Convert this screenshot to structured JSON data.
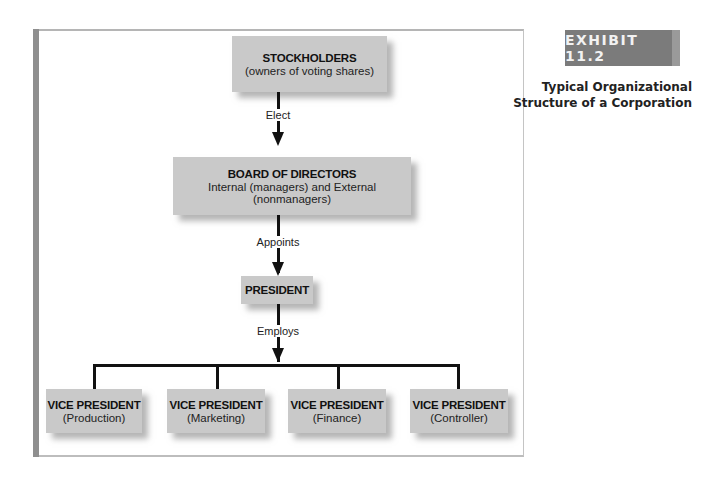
{
  "exhibit": {
    "badge": "EXHIBIT 11.2",
    "caption_line1": "Typical Organizational",
    "caption_line2": "Structure of a Corporation"
  },
  "chart": {
    "nodes": {
      "stockholders": {
        "title": "STOCKHOLDERS",
        "subtitle": "(owners of voting shares)"
      },
      "board": {
        "title": "BOARD OF DIRECTORS",
        "subtitle": "Internal (managers) and External (nonmanagers)"
      },
      "president": {
        "title": "PRESIDENT"
      },
      "vps": [
        {
          "title": "VICE PRESIDENT",
          "subtitle": "(Production)"
        },
        {
          "title": "VICE PRESIDENT",
          "subtitle": "(Marketing)"
        },
        {
          "title": "VICE PRESIDENT",
          "subtitle": "(Finance)"
        },
        {
          "title": "VICE PRESIDENT",
          "subtitle": "(Controller)"
        }
      ]
    },
    "edges": {
      "elect": "Elect",
      "appoints": "Appoints",
      "employs": "Employs"
    }
  },
  "colors": {
    "box_fill": "#c9c9c9",
    "badge_fill": "#7b7b7b",
    "frame_bar": "#8f8f8f",
    "line": "#111111"
  }
}
